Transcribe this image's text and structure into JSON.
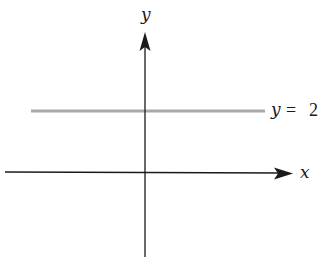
{
  "diagram": {
    "axes": {
      "x_label": "x",
      "y_label": "y",
      "axis_color": "#1a1a1a"
    },
    "line": {
      "label": "y = 2",
      "equation_var": "y",
      "equation_eq": "=",
      "equation_val": "2",
      "color": "#a9a9a9"
    }
  }
}
